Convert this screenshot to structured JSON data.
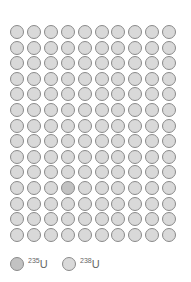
{
  "diagram": {
    "rows": 14,
    "cols": 10,
    "pitch_x": 16.9,
    "pitch_y": 15.6,
    "colors": {
      "u238_fill": "#d9d9d9",
      "u235_fill": "#c2c2c2",
      "border": "#8a8a8a"
    },
    "u235_positions": [
      [
        10,
        3
      ]
    ]
  },
  "legend": {
    "items": [
      {
        "mass": "235",
        "symbol": "U",
        "fill": "#c2c2c2"
      },
      {
        "mass": "238",
        "symbol": "U",
        "fill": "#d9d9d9"
      }
    ]
  }
}
